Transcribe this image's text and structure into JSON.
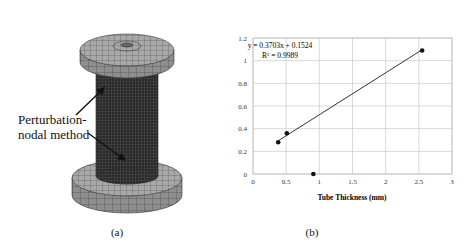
{
  "figure": {
    "panels": [
      {
        "id": "a",
        "caption": "(a)",
        "annotation_line1": "Perturbation-",
        "annotation_line2": "nodal method"
      },
      {
        "id": "b",
        "caption": "(b)"
      }
    ]
  },
  "chart_data": {
    "type": "scatter",
    "title": "",
    "xlabel": "Tube Thickness (mm)",
    "ylabel": "Perturbation Amplitude (mm)",
    "xlim": [
      0,
      3
    ],
    "ylim": [
      0,
      1.2
    ],
    "x_ticks": [
      "0",
      "0.5",
      "1",
      "1.5",
      "2",
      "2.5",
      "3"
    ],
    "y_ticks": [
      "0",
      "0.2",
      "0.4",
      "0.6",
      "0.8",
      "1",
      "1.2"
    ],
    "grid": true,
    "series": [
      {
        "name": "Data",
        "x": [
          0.38,
          0.51,
          0.91,
          2.55
        ],
        "y": [
          0.28,
          0.36,
          0.0,
          1.09
        ],
        "marker": "circle",
        "color": "#111111"
      }
    ],
    "trendline": {
      "equation": "y = 0.3703x + 0.1524",
      "r_squared": "R² = 0.9989",
      "slope": 0.3703,
      "intercept": 0.1524,
      "x_start": 0.38,
      "x_end": 2.55,
      "color": "#333333"
    }
  }
}
